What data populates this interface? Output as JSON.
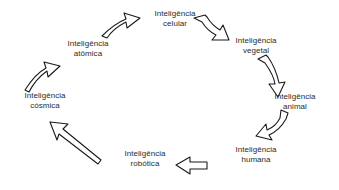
{
  "diagram": {
    "type": "cycle-diagram",
    "direction": "clockwise",
    "background_color": "#ffffff",
    "text_color": "#2b2b2b",
    "arrow_stroke_color": "#1a1a1a",
    "arrow_fill_color": "#ffffff",
    "nodes": [
      {
        "id": "celular",
        "line1": "Inteligência",
        "line2": "celular",
        "x": 175,
        "y": 18
      },
      {
        "id": "vegetal",
        "line1": "Inteligência",
        "line2": "vegetal",
        "x": 256,
        "y": 45
      },
      {
        "id": "animal",
        "line1": "Inteligência",
        "line2": "animal",
        "x": 295,
        "y": 101
      },
      {
        "id": "humana",
        "line1": "Inteligência",
        "line2": "humana",
        "x": 256,
        "y": 154
      },
      {
        "id": "robotica",
        "line1": "Inteligência",
        "line2": "robótica",
        "x": 145,
        "y": 158
      },
      {
        "id": "cosmica",
        "line1": "Inteligência",
        "line2": "cósmica",
        "x": 45,
        "y": 100
      },
      {
        "id": "atomica",
        "line1": "Inteligência",
        "line2": "atômica",
        "x": 88,
        "y": 48
      },
      {
        "id": "celular_end",
        "line1": "",
        "line2": "",
        "x": 0,
        "y": 0
      }
    ],
    "arrows": [
      {
        "id": "atomica-to-celular",
        "from": "atomica",
        "to": "celular",
        "shape": "curved-up-right"
      },
      {
        "id": "celular-to-vegetal",
        "from": "celular",
        "to": "vegetal",
        "shape": "curved-down-right"
      },
      {
        "id": "vegetal-to-animal",
        "from": "vegetal",
        "to": "animal",
        "shape": "curved-down"
      },
      {
        "id": "animal-to-humana",
        "from": "animal",
        "to": "humana",
        "shape": "curved-down-left"
      },
      {
        "id": "humana-to-robotica",
        "from": "humana",
        "to": "robotica",
        "shape": "straight-left"
      },
      {
        "id": "robotica-to-cosmica",
        "from": "robotica",
        "to": "cosmica",
        "shape": "long-diagonal-up-left"
      },
      {
        "id": "cosmica-to-atomica",
        "from": "cosmica",
        "to": "atomica",
        "shape": "curved-up-right"
      }
    ]
  }
}
